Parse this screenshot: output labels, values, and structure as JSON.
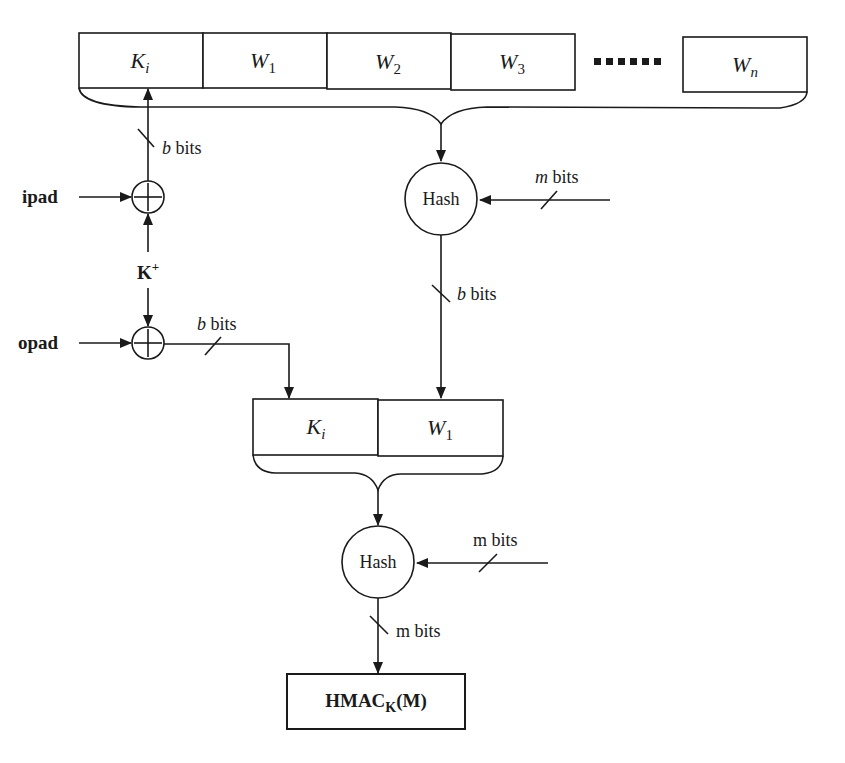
{
  "diagram": {
    "top_blocks": [
      {
        "main": "K",
        "sub": "i"
      },
      {
        "main": "W",
        "sub": "1"
      },
      {
        "main": "W",
        "sub": "2"
      },
      {
        "main": "W",
        "sub": "3"
      },
      {
        "main": "W",
        "sub": "n"
      }
    ],
    "ellipsis": "......",
    "inputs": {
      "ipad": "ipad",
      "opad": "opad",
      "key": "K",
      "key_sup": "+"
    },
    "edge_labels": {
      "ipad_to_ki_italic": "b",
      "ipad_to_ki": " bits",
      "opad_out_italic": "b",
      "opad_out": " bits",
      "hash1_in_italic": "m",
      "hash1_in": " bits",
      "hash1_out_italic": "b",
      "hash1_out": " bits",
      "hash2_in": "m bits",
      "hash2_out": "m bits"
    },
    "hash_nodes": [
      "Hash",
      "Hash"
    ],
    "bottom_blocks": [
      {
        "main": "K",
        "sub": "i"
      },
      {
        "main": "W",
        "sub": "1"
      }
    ],
    "output": {
      "main": "HMAC",
      "sub": "K",
      "suffix": "(M)"
    },
    "colors": {
      "stroke": "#1a1a1a",
      "background": "#ffffff"
    }
  }
}
